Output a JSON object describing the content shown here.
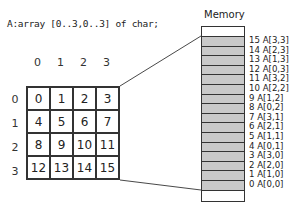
{
  "declaration": "A:array [0..3,0..3] of char;",
  "matrix": {
    "column_headers": [
      "0",
      "1",
      "2",
      "3"
    ],
    "row_headers": [
      "0",
      "1",
      "2",
      "3"
    ],
    "cells": [
      [
        "0",
        "1",
        "2",
        "3"
      ],
      [
        "4",
        "5",
        "6",
        "7"
      ],
      [
        "8",
        "9",
        "10",
        "11"
      ],
      [
        "12",
        "13",
        "14",
        "15"
      ]
    ]
  },
  "memory": {
    "title": "Memory",
    "slots": [
      "15 A[3,3]",
      "14 A[2,3]",
      "13 A[1,3]",
      "12 A[0,3]",
      "11 A[3,2]",
      "10 A[2,2]",
      "9  A[1,2]",
      "8  A[0,2]",
      "7  A[3,1]",
      "6  A[2,1]",
      "5  A[1,1]",
      "4  A[0,1]",
      "3  A[3,0]",
      "2  A[2,0]",
      "1  A[1,0]",
      "0  A[0,0]"
    ],
    "colors": {
      "filled": "#c8c8c8",
      "empty": "#ffffff",
      "stroke": "#333333"
    }
  }
}
